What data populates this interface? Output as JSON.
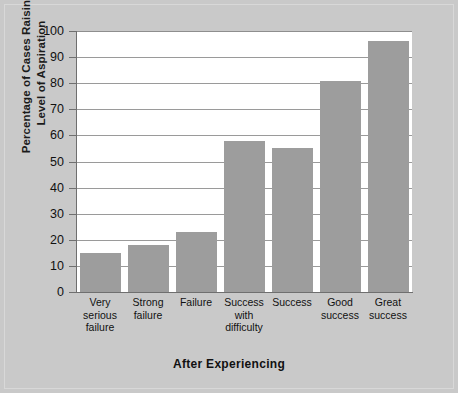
{
  "chart_data": {
    "type": "bar",
    "title": "",
    "xlabel": "After Experiencing",
    "ylabel_line1": "Percentage of Cases Raising",
    "ylabel_line2": "Level of Aspiration",
    "categories": [
      "Very serious failure",
      "Strong failure",
      "Failure",
      "Success with difficulty",
      "Success",
      "Good success",
      "Great success"
    ],
    "category_lines": [
      [
        "Very",
        "serious",
        "failure"
      ],
      [
        "Strong",
        "failure"
      ],
      [
        "Failure"
      ],
      [
        "Success",
        "with",
        "difficulty"
      ],
      [
        "Success"
      ],
      [
        "Good",
        "success"
      ],
      [
        "Great",
        "success"
      ]
    ],
    "values": [
      15,
      18,
      23,
      58,
      55,
      81,
      96
    ],
    "ylim": [
      0,
      100
    ],
    "ytick_values": [
      100,
      90,
      80,
      70,
      60,
      50,
      40,
      30,
      20,
      10,
      0
    ],
    "ytick_labels": [
      "100",
      "90",
      "80",
      "70",
      "60",
      "50",
      "40",
      "30",
      "20",
      "10",
      "0"
    ],
    "grid": true,
    "legend": false,
    "bar_color": "#9d9d9d",
    "plot_background": "#ffffff",
    "figure_background": "#c9c9c9",
    "axis_color": "#6f6f6f",
    "gridline_color": "#9a9a9a"
  }
}
